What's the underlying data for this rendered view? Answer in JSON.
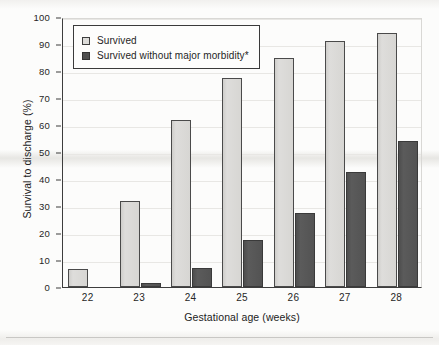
{
  "chart_data": {
    "type": "bar",
    "title": "",
    "xlabel": "Gestational age (weeks)",
    "ylabel": "Survival to discharge (%)",
    "categories": [
      "22",
      "23",
      "24",
      "25",
      "26",
      "27",
      "28"
    ],
    "ylim": [
      0,
      100
    ],
    "yticks": [
      0,
      10,
      20,
      30,
      40,
      50,
      60,
      70,
      80,
      90,
      100
    ],
    "grid": true,
    "legend_position": "top-left inside plot area",
    "series": [
      {
        "name": "Survived",
        "color": "#d9d8d5",
        "values": [
          6.5,
          32,
          62,
          77.5,
          85,
          91,
          94
        ]
      },
      {
        "name": "Survived without major morbidity*",
        "color": "#565656",
        "values": [
          0,
          1.5,
          7,
          17.5,
          27.5,
          42.5,
          54
        ]
      }
    ],
    "annotations": [
      "*"
    ]
  },
  "axes": {
    "y_tick_labels": [
      "0",
      "10",
      "20",
      "30",
      "40",
      "50",
      "60",
      "70",
      "80",
      "90",
      "100"
    ],
    "x_tick_labels": [
      "22",
      "23",
      "24",
      "25",
      "26",
      "27",
      "28"
    ],
    "y_title": "Survival to discharge (%)",
    "x_title": "Gestational age (weeks)"
  },
  "legend": {
    "items": [
      {
        "label": "Survived",
        "swatch": "light-square-swatch"
      },
      {
        "label": "Survived without major morbidity*",
        "swatch": "dark-square-swatch"
      }
    ]
  },
  "colors": {
    "series_light": "#d9d8d5",
    "series_dark": "#565656",
    "axis": "#3d3d3d",
    "grid": "#e8e7e4",
    "background": "#fcfcfb"
  }
}
